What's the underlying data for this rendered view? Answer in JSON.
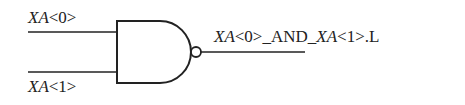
{
  "diagram": {
    "type": "logic-gate",
    "gate": "NAND",
    "inputs": [
      {
        "label_italic": "XA",
        "label_rest": "<0>"
      },
      {
        "label_italic": "XA",
        "label_rest": "<1>"
      }
    ],
    "output": {
      "parts": [
        {
          "text": "XA",
          "italic": true
        },
        {
          "text": "<0>_AND_",
          "italic": false
        },
        {
          "text": "XA",
          "italic": true
        },
        {
          "text": "<1>.L",
          "italic": false
        }
      ]
    },
    "colors": {
      "stroke": "#222222",
      "background": "#ffffff"
    }
  }
}
